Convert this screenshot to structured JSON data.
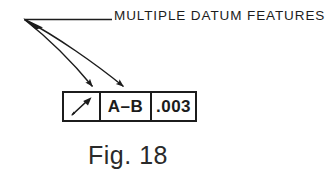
{
  "figure": {
    "background_color": "#ffffff",
    "ink_color": "#1c1c1c",
    "caption": "Fig. 18",
    "callout_label": "MULTIPLE DATUM FEATURES"
  },
  "feature_control_frame": {
    "cells": [
      {
        "key": "geometric_characteristic",
        "type": "symbol",
        "symbol_name": "circular-runout-symbol",
        "text": ""
      },
      {
        "key": "datum_reference",
        "type": "text",
        "text": "A–B"
      },
      {
        "key": "tolerance_value",
        "type": "text",
        "text": ".003"
      }
    ]
  },
  "leaders": {
    "count": 2,
    "description": "two curved leader lines from a common origin to arrowheads on the frame",
    "origin": {
      "x": 24,
      "y": 19
    },
    "horizontal_run_end": {
      "x": 112,
      "y": 19
    },
    "arrow_targets": [
      {
        "x": 95,
        "y": 89
      },
      {
        "x": 126,
        "y": 89
      }
    ]
  }
}
